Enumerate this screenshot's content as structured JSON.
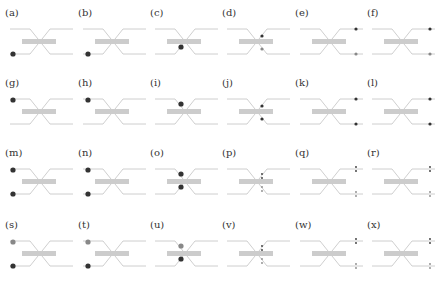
{
  "figure": {
    "colors": {
      "waveguide": "#c8c8c8",
      "coupler_bar": "#cccccc",
      "particle_dark": "#333333",
      "particle_gray": "#888888"
    },
    "layout": {
      "cols": 6,
      "rows": 4,
      "col_x": [
        5,
        78,
        150,
        222,
        295,
        367
      ],
      "row_y": [
        8,
        78,
        148,
        220
      ]
    },
    "panels": [
      {
        "label": "(a)",
        "dots": [
          {
            "pos": "in-bottom",
            "color": "dark",
            "size": "large"
          }
        ]
      },
      {
        "label": "(b)",
        "dots": [
          {
            "pos": "in-bottom-2",
            "color": "dark",
            "size": "large"
          }
        ]
      },
      {
        "label": "(c)",
        "dots": [
          {
            "pos": "mid-bottom",
            "color": "dark",
            "size": "large"
          }
        ]
      },
      {
        "label": "(d)",
        "dots": [
          {
            "pos": "center-top",
            "color": "dark",
            "size": "small"
          },
          {
            "pos": "center-bottom",
            "color": "gray",
            "size": "small"
          }
        ]
      },
      {
        "label": "(e)",
        "dots": [
          {
            "pos": "out-top",
            "color": "dark",
            "size": "small"
          },
          {
            "pos": "out-bottom",
            "color": "gray",
            "size": "small"
          }
        ]
      },
      {
        "label": "(f)",
        "dots": [
          {
            "pos": "out-top-2",
            "color": "dark",
            "size": "small"
          },
          {
            "pos": "out-bottom-2",
            "color": "gray",
            "size": "small"
          }
        ]
      },
      {
        "label": "(g)",
        "dots": [
          {
            "pos": "in-top",
            "color": "dark",
            "size": "large"
          }
        ]
      },
      {
        "label": "(h)",
        "dots": [
          {
            "pos": "in-top-2",
            "color": "dark",
            "size": "large"
          }
        ]
      },
      {
        "label": "(i)",
        "dots": [
          {
            "pos": "mid-top",
            "color": "dark",
            "size": "large"
          }
        ]
      },
      {
        "label": "(j)",
        "dots": [
          {
            "pos": "center-top",
            "color": "dark",
            "size": "small"
          },
          {
            "pos": "center-bottom",
            "color": "dark",
            "size": "small"
          }
        ]
      },
      {
        "label": "(k)",
        "dots": [
          {
            "pos": "out-top",
            "color": "dark",
            "size": "small"
          },
          {
            "pos": "out-bottom",
            "color": "dark",
            "size": "small"
          }
        ]
      },
      {
        "label": "(l)",
        "dots": [
          {
            "pos": "out-top-2",
            "color": "dark",
            "size": "small"
          },
          {
            "pos": "out-bottom-2",
            "color": "dark",
            "size": "small"
          }
        ]
      },
      {
        "label": "(m)",
        "dots": [
          {
            "pos": "in-top",
            "color": "dark",
            "size": "large"
          },
          {
            "pos": "in-bottom",
            "color": "dark",
            "size": "large"
          }
        ]
      },
      {
        "label": "(n)",
        "dots": [
          {
            "pos": "in-top-2",
            "color": "dark",
            "size": "large"
          },
          {
            "pos": "in-bottom-2",
            "color": "dark",
            "size": "large"
          }
        ]
      },
      {
        "label": "(o)",
        "dots": [
          {
            "pos": "mid-top",
            "color": "dark",
            "size": "large"
          },
          {
            "pos": "mid-bottom",
            "color": "dark",
            "size": "large"
          }
        ]
      },
      {
        "label": "(p)",
        "dots": [
          {
            "pos": "center-top",
            "color": "dark",
            "size": "tiny-pair"
          },
          {
            "pos": "center-bottom",
            "color": "gray",
            "size": "tiny-pair"
          }
        ]
      },
      {
        "label": "(q)",
        "dots": [
          {
            "pos": "out-top",
            "color": "dark",
            "size": "tiny-pair"
          },
          {
            "pos": "out-bottom",
            "color": "gray",
            "size": "tiny-pair"
          }
        ]
      },
      {
        "label": "(r)",
        "dots": [
          {
            "pos": "out-top-2",
            "color": "dark",
            "size": "tiny-pair"
          },
          {
            "pos": "out-bottom-2",
            "color": "gray",
            "size": "tiny-pair"
          }
        ]
      },
      {
        "label": "(s)",
        "dots": [
          {
            "pos": "in-top",
            "color": "gray",
            "size": "large"
          },
          {
            "pos": "in-bottom",
            "color": "dark",
            "size": "large"
          }
        ]
      },
      {
        "label": "(t)",
        "dots": [
          {
            "pos": "in-top-2",
            "color": "gray",
            "size": "large"
          },
          {
            "pos": "in-bottom-2",
            "color": "dark",
            "size": "large"
          }
        ]
      },
      {
        "label": "(u)",
        "dots": [
          {
            "pos": "mid-top",
            "color": "gray",
            "size": "large"
          },
          {
            "pos": "mid-bottom",
            "color": "dark",
            "size": "large"
          }
        ]
      },
      {
        "label": "(v)",
        "dots": [
          {
            "pos": "center-top",
            "color": "dark",
            "size": "tiny-pair"
          },
          {
            "pos": "center-bottom",
            "color": "gray",
            "size": "tiny-pair"
          }
        ]
      },
      {
        "label": "(w)",
        "dots": [
          {
            "pos": "out-top",
            "color": "dark",
            "size": "tiny-pair"
          },
          {
            "pos": "out-bottom",
            "color": "gray",
            "size": "tiny-pair"
          }
        ]
      },
      {
        "label": "(x)",
        "dots": [
          {
            "pos": "out-top-2",
            "color": "dark",
            "size": "tiny-pair"
          },
          {
            "pos": "out-bottom-2",
            "color": "gray",
            "size": "tiny-pair"
          }
        ]
      }
    ]
  }
}
